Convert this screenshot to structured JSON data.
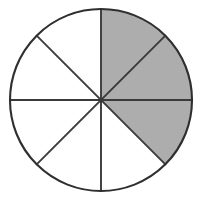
{
  "figure": {
    "shape": "circle",
    "background_color": "#ffffff",
    "outline_color": "#2f2f2f",
    "divider_color": "#3a3a3a",
    "shaded_color": "#adadad",
    "unshaded_color": "#ffffff",
    "center_x": 101,
    "center_y": 100,
    "radius": 91,
    "total_sectors": 8,
    "shaded_sectors": 3,
    "unshaded_sectors": 5,
    "fraction_shaded": "3/8",
    "sector_angle_degrees": 45
  },
  "chart_data": {
    "type": "pie",
    "title": "",
    "xlabel": "",
    "ylabel": "",
    "legend_position": "none",
    "grid": false,
    "categories": [
      "sector-1",
      "sector-2",
      "sector-3",
      "sector-4",
      "sector-5",
      "sector-6",
      "sector-7",
      "sector-8"
    ],
    "values": [
      45,
      45,
      45,
      45,
      45,
      45,
      45,
      45
    ],
    "start_angle_degrees": 0,
    "direction": "clockwise",
    "slices": [
      {
        "name": "sector-1",
        "start_deg": 0,
        "end_deg": 45,
        "shaded": true,
        "color": "#adadad"
      },
      {
        "name": "sector-2",
        "start_deg": 45,
        "end_deg": 90,
        "shaded": true,
        "color": "#adadad"
      },
      {
        "name": "sector-3",
        "start_deg": 90,
        "end_deg": 135,
        "shaded": true,
        "color": "#adadad"
      },
      {
        "name": "sector-4",
        "start_deg": 135,
        "end_deg": 180,
        "shaded": false,
        "color": "#ffffff"
      },
      {
        "name": "sector-5",
        "start_deg": 180,
        "end_deg": 225,
        "shaded": false,
        "color": "#ffffff"
      },
      {
        "name": "sector-6",
        "start_deg": 225,
        "end_deg": 270,
        "shaded": false,
        "color": "#ffffff"
      },
      {
        "name": "sector-7",
        "start_deg": 270,
        "end_deg": 315,
        "shaded": false,
        "color": "#ffffff"
      },
      {
        "name": "sector-8",
        "start_deg": 315,
        "end_deg": 360,
        "shaded": false,
        "color": "#ffffff"
      }
    ]
  }
}
